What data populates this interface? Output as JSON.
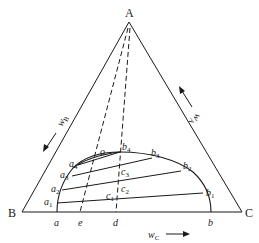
{
  "diagram": {
    "type": "ternary-phase-diagram",
    "vertices": {
      "A": {
        "label": "A",
        "x": 129,
        "y": 22
      },
      "B": {
        "label": "B",
        "x": 22,
        "y": 212
      },
      "C": {
        "label": "C",
        "x": 242,
        "y": 212
      }
    },
    "axis_labels": {
      "left": {
        "text": "w",
        "sub": "B",
        "arrow": "down-left"
      },
      "right": {
        "text": "w",
        "sub": "A",
        "arrow": "up-left"
      },
      "bottom": {
        "text": "w",
        "sub": "C",
        "arrow": "right"
      }
    },
    "base_points": [
      {
        "label": "a",
        "x": 57
      },
      {
        "label": "e",
        "x": 80
      },
      {
        "label": "d",
        "x": 116
      },
      {
        "label": "b",
        "x": 211
      }
    ],
    "binodal_points_left": [
      {
        "label": "a",
        "sub": "1"
      },
      {
        "label": "a",
        "sub": "2"
      },
      {
        "label": "a",
        "sub": "3"
      },
      {
        "label": "a",
        "sub": "4"
      }
    ],
    "binodal_points_right": [
      {
        "label": "b",
        "sub": "1"
      },
      {
        "label": "b",
        "sub": "2"
      },
      {
        "label": "b",
        "sub": "3"
      },
      {
        "label": "b",
        "sub": "4"
      }
    ],
    "mixture_points": [
      {
        "label": "c",
        "sub": "1"
      },
      {
        "label": "c",
        "sub": "2"
      },
      {
        "label": "c",
        "sub": "3"
      },
      {
        "label": "o",
        "sub": ""
      }
    ],
    "tie_lines": [
      {
        "from": "a1",
        "to": "b1"
      },
      {
        "from": "a2",
        "to": "b2"
      },
      {
        "from": "a3",
        "to": "b3"
      },
      {
        "from": "a4",
        "to": "b4"
      }
    ],
    "dashed_lines": [
      {
        "from": "A",
        "to": "e"
      },
      {
        "from": "A",
        "to": "d"
      }
    ]
  }
}
